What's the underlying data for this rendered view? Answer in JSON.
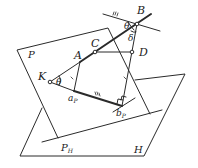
{
  "figure": {
    "type": "geometry-diagram",
    "labels": {
      "B": "B",
      "C": "C",
      "D": "D",
      "A": "A",
      "K": "K",
      "P": "P",
      "H": "H",
      "aP_main": "a",
      "aP_sub": "P",
      "bP_main": "b",
      "bP_sub": "P",
      "PH_main": "P",
      "PH_sub": "H",
      "theta_B": "θ",
      "theta_K": "θ",
      "delta": "δ"
    },
    "marks": {
      "triple_tick": "III",
      "single_tick": "I"
    }
  }
}
